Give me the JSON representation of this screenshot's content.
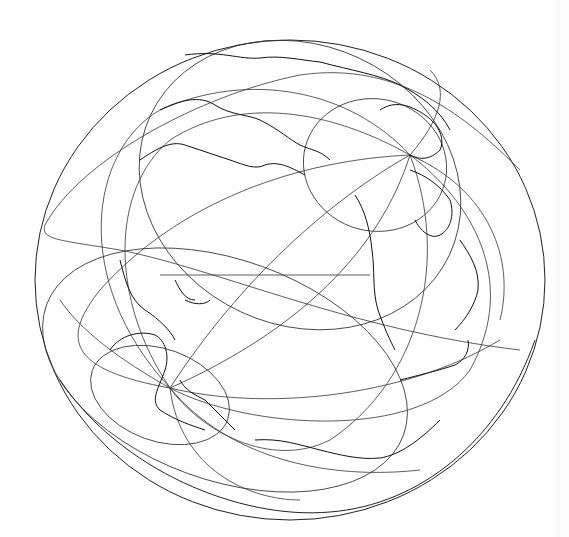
{
  "map": {
    "type": "oblique orthographic globe",
    "background": "#ffffff",
    "line_color": "#222222",
    "globe": {
      "cx": 290,
      "cy": 280,
      "rx": 255,
      "ry": 240
    },
    "north_pole": {
      "x": 410,
      "y": 155
    },
    "south_pole": {
      "x": 170,
      "y": 388
    },
    "layers": [
      "globe-outline",
      "graticule",
      "coastlines"
    ]
  }
}
